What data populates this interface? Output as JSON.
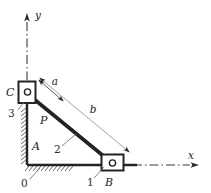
{
  "figure": {
    "kind": "kinematic-mechanism-diagram",
    "colors": {
      "line": "#232323",
      "dimension": "#8d8d8d",
      "hatch": "#4a4a4a",
      "background": "#ffffff"
    },
    "axes": {
      "y_label": "y",
      "x_label": "x",
      "y_axis_style": "dash-dot centerline with arrow",
      "x_axis_style": "dash-dot centerline with arrow"
    },
    "labels": {
      "slider_c": "C",
      "link_3": "3",
      "link_2": "2",
      "link_1": "1",
      "ground_0": "0",
      "joint_a": "A",
      "joint_b": "B",
      "point_p": "P",
      "dim_a": "a",
      "dim_b": "b"
    }
  }
}
